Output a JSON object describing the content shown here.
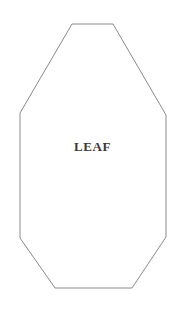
{
  "canvas": {
    "width": 185,
    "height": 313,
    "background_color": "#ffffff"
  },
  "shape": {
    "name": "leaf-template-outline",
    "type": "polygon",
    "sides": 8,
    "stroke_color": "#8a8a8a",
    "stroke_width": 1,
    "fill_color": "none",
    "points": "72,24 113,24 166,115 166,237 132,288 55,288 20,238 20,113",
    "vertices": [
      {
        "x": 72,
        "y": 24
      },
      {
        "x": 113,
        "y": 24
      },
      {
        "x": 166,
        "y": 115
      },
      {
        "x": 166,
        "y": 237
      },
      {
        "x": 132,
        "y": 288
      },
      {
        "x": 55,
        "y": 288
      },
      {
        "x": 20,
        "y": 238
      },
      {
        "x": 20,
        "y": 113
      }
    ]
  },
  "label": {
    "text": "LEAF",
    "color": "#3a3a3a"
  }
}
